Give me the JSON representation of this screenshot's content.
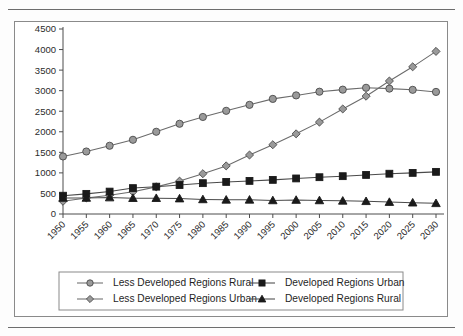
{
  "chart_data": {
    "type": "line",
    "title": "",
    "subtitle": "",
    "xlabel": "",
    "ylabel": "",
    "xlim": [
      1950,
      2030
    ],
    "ylim": [
      0,
      4500
    ],
    "ytick_step": 500,
    "grid": false,
    "legend_position": "bottom",
    "legend_columns": 2,
    "x_tick_rotation": -45,
    "categories": [
      "1950",
      "1955",
      "1960",
      "1965",
      "1970",
      "1975",
      "1980",
      "1985",
      "1990",
      "1995",
      "2000",
      "2005",
      "2010",
      "2015",
      "2020",
      "2025",
      "2030"
    ],
    "ytick_labels": [
      "0",
      "500",
      "1000",
      "1500",
      "2000",
      "2500",
      "3000",
      "3500",
      "4000",
      "4500"
    ],
    "ytick_values": [
      0,
      500,
      1000,
      1500,
      2000,
      2500,
      3000,
      3500,
      4000,
      4500
    ],
    "series": [
      {
        "name": "Less Developed Regions Rural",
        "marker": "circle",
        "marker_fill": "#9a9a9a",
        "marker_stroke": "#4a4a4a",
        "line_color": "#6b6b6b",
        "values": [
          1400,
          1520,
          1660,
          1805,
          2000,
          2195,
          2360,
          2510,
          2655,
          2800,
          2885,
          2975,
          3025,
          3070,
          3050,
          3020,
          2970
        ]
      },
      {
        "name": "Less Developed Regions Urban",
        "marker": "diamond",
        "marker_fill": "#9a9a9a",
        "marker_stroke": "#4a4a4a",
        "line_color": "#6b6b6b",
        "values": [
          310,
          390,
          455,
          540,
          660,
          800,
          980,
          1170,
          1435,
          1685,
          1950,
          2235,
          2555,
          2865,
          3235,
          3580,
          3955
        ]
      },
      {
        "name": "Developed Regions Urban",
        "marker": "square",
        "marker_fill": "#1a1a1a",
        "marker_stroke": "#1a1a1a",
        "line_color": "#4a4a4a",
        "values": [
          445,
          490,
          545,
          630,
          665,
          705,
          750,
          780,
          805,
          830,
          865,
          895,
          920,
          950,
          980,
          1000,
          1025
        ]
      },
      {
        "name": "Developed Regions Rural",
        "marker": "triangle",
        "marker_fill": "#1a1a1a",
        "marker_stroke": "#1a1a1a",
        "line_color": "#4a4a4a",
        "values": [
          390,
          390,
          400,
          385,
          385,
          375,
          355,
          345,
          345,
          330,
          340,
          330,
          320,
          310,
          290,
          275,
          260
        ]
      }
    ]
  },
  "legend": {
    "entries": [
      "Less Developed Regions Rural",
      "Developed Regions Urban",
      "Less Developed Regions Urban",
      "Developed Regions Rural"
    ]
  },
  "colors": {
    "frame_border": "#8a8a8a",
    "rule": "#6d6d6d",
    "axis": "#4d4d4d",
    "light_marker": "#9a9a9a",
    "dark_marker": "#1a1a1a",
    "background": "#ffffff"
  }
}
